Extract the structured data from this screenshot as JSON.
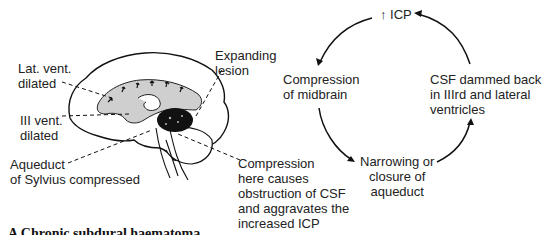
{
  "brain_figure": {
    "labels": {
      "lat_vent": [
        "Lat. vent.",
        "dilated"
      ],
      "iii_vent": [
        "III vent.",
        "dilated"
      ],
      "aqueduct": [
        "Aqueduct",
        "of Sylvius compressed"
      ],
      "lesion": [
        "Expanding",
        "lesion"
      ],
      "compression_note": [
        "Compression",
        "here causes",
        "obstruction of CSF",
        "and aggravates the",
        "increased ICP"
      ]
    }
  },
  "cycle_diagram": {
    "nodes": {
      "top": "↑ ICP",
      "left": [
        "Compression",
        "of midbrain"
      ],
      "bottom": [
        "Narrowing or",
        "closure of",
        "aqueduct"
      ],
      "right": [
        "CSF dammed back",
        "in IIIrd and lateral",
        "ventricles"
      ]
    },
    "arrow_order": [
      "↑ ICP",
      "Compression of midbrain",
      "Narrowing or closure of aqueduct",
      "CSF dammed back in IIIrd and lateral ventricles"
    ]
  },
  "caption": "A  Chronic subdural haematoma"
}
